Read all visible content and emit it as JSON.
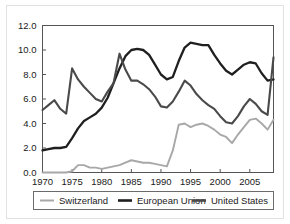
{
  "chart_data": {
    "type": "line",
    "title": "",
    "subtitle": "",
    "xlabel": "",
    "ylabel": "",
    "xlim": [
      1970,
      2009
    ],
    "ylim": [
      0.0,
      12.0
    ],
    "grid": false,
    "legend_position": "bottom",
    "yticks": [
      "0.0",
      "2.0",
      "4.0",
      "6.0",
      "8.0",
      "10.0",
      "12.0"
    ],
    "ytick_values": [
      0.0,
      2.0,
      4.0,
      6.0,
      8.0,
      10.0,
      12.0
    ],
    "xticks": [
      "1970",
      "1975",
      "1980",
      "1985",
      "1990",
      "1995",
      "2000",
      "2005"
    ],
    "xtick_values": [
      1970,
      1975,
      1980,
      1985,
      1990,
      1995,
      2000,
      2005
    ],
    "x": [
      1970,
      1971,
      1972,
      1973,
      1974,
      1975,
      1976,
      1977,
      1978,
      1979,
      1980,
      1981,
      1982,
      1983,
      1984,
      1985,
      1986,
      1987,
      1988,
      1989,
      1990,
      1991,
      1992,
      1993,
      1994,
      1995,
      1996,
      1997,
      1998,
      1999,
      2000,
      2001,
      2002,
      2003,
      2004,
      2005,
      2006,
      2007,
      2008,
      2009
    ],
    "series": [
      {
        "name": "Switzerland",
        "color": "#a8a8a8",
        "width": 1.9,
        "values": [
          0.0,
          0.0,
          0.0,
          0.0,
          0.0,
          0.1,
          0.6,
          0.6,
          0.4,
          0.4,
          0.3,
          0.4,
          0.5,
          0.6,
          0.8,
          1.0,
          0.9,
          0.8,
          0.8,
          0.7,
          0.6,
          0.5,
          1.8,
          3.9,
          4.0,
          3.7,
          3.9,
          4.0,
          3.8,
          3.5,
          3.1,
          2.9,
          2.4,
          3.1,
          3.7,
          4.3,
          4.4,
          4.0,
          3.5,
          4.3
        ]
      },
      {
        "name": "European Union",
        "color": "#1f1f1f",
        "width": 2.3,
        "values": [
          1.8,
          1.9,
          2.0,
          2.0,
          2.1,
          2.8,
          3.6,
          4.2,
          4.5,
          4.8,
          5.3,
          6.1,
          7.3,
          8.5,
          9.5,
          10.0,
          10.1,
          10.0,
          9.6,
          8.8,
          8.0,
          7.6,
          7.8,
          9.1,
          10.2,
          10.6,
          10.5,
          10.4,
          10.4,
          9.6,
          8.9,
          8.3,
          8.0,
          8.4,
          8.8,
          9.0,
          8.9,
          8.1,
          7.5,
          7.6
        ]
      },
      {
        "name": "United States",
        "color": "#4a4a4a",
        "width": 2.1,
        "values": [
          5.1,
          5.5,
          5.9,
          5.2,
          4.8,
          8.5,
          7.6,
          7.0,
          6.5,
          6.0,
          5.8,
          6.6,
          7.3,
          9.7,
          8.4,
          7.5,
          7.5,
          7.2,
          6.8,
          6.2,
          5.4,
          5.3,
          5.8,
          6.6,
          7.5,
          7.1,
          6.4,
          5.9,
          5.5,
          5.2,
          4.6,
          4.1,
          4.0,
          4.6,
          5.4,
          6.0,
          5.6,
          5.0,
          4.7,
          9.4
        ]
      }
    ],
    "legend_entries": [
      {
        "label": "Switzerland",
        "color": "#a8a8a8"
      },
      {
        "label": "European Union",
        "color": "#1f1f1f"
      },
      {
        "label": "United States",
        "color": "#4a4a4a"
      }
    ]
  }
}
